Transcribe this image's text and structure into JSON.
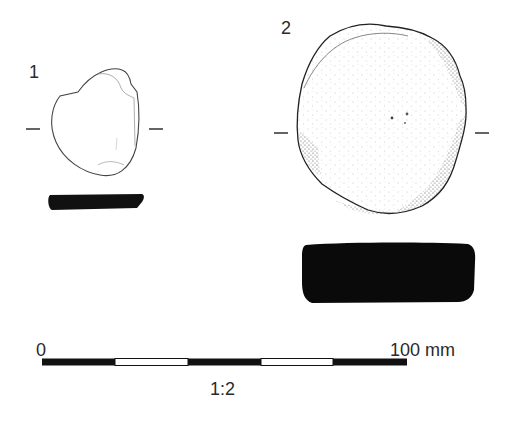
{
  "figure": {
    "objects": [
      {
        "number": "1",
        "view": "plan and section",
        "section_fill": "#111111"
      },
      {
        "number": "2",
        "view": "plan and section",
        "section_fill": "#0a0a0a"
      }
    ],
    "scale_bar": {
      "start_label": "0",
      "end_label": "100 mm",
      "ratio_label": "1:2",
      "segments": 5,
      "segment_colors": [
        "#111111",
        "#ffffff",
        "#111111",
        "#ffffff",
        "#111111"
      ]
    }
  }
}
